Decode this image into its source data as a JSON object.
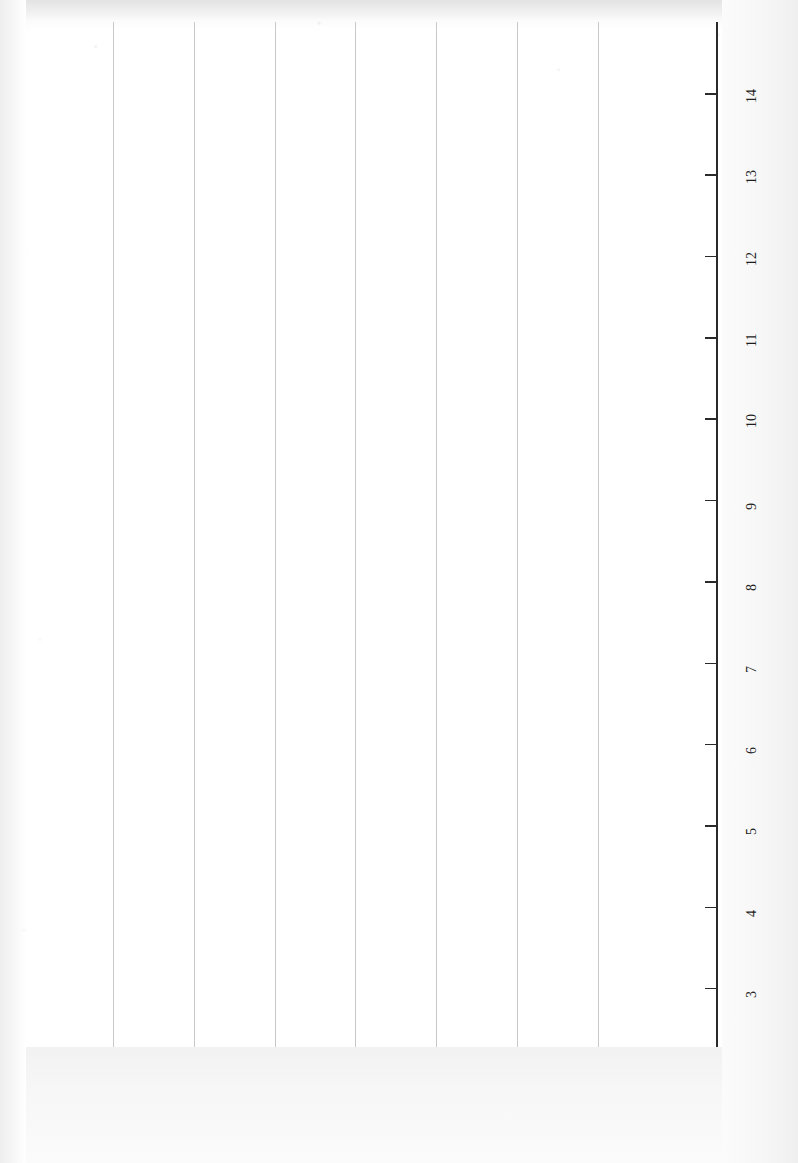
{
  "chart_data": {
    "type": "scatter",
    "title": "",
    "xlabel": "Voter Eligibility Percent",
    "ylabel": "Democratic Advantage",
    "orientation": "rotated-90",
    "grid": "vertical-gridlines-on-democratic-advantage-axis",
    "legend": "none",
    "xlim": [
      2.6,
      14.6
    ],
    "ylim": [
      -2.9,
      4.1
    ],
    "x_ticks": [
      3,
      4,
      5,
      6,
      7,
      8,
      9,
      10,
      11,
      12,
      13,
      14
    ],
    "y_ticks": [
      "3.59",
      "2.59",
      "1.59",
      "0.59",
      "-0.41",
      "-1.41",
      "-2.41"
    ],
    "y_tick_values": [
      3.59,
      2.59,
      1.59,
      0.59,
      -0.41,
      -1.41,
      -2.41
    ],
    "point_label_field": "state",
    "points": [
      {
        "state": "CO",
        "x": 4.45,
        "y": 4.0
      },
      {
        "state": "NH",
        "x": 2.95,
        "y": 3.16
      },
      {
        "state": "NE",
        "x": 5.95,
        "y": 3.7
      },
      {
        "state": "DE",
        "x": 6.45,
        "y": 3.52
      },
      {
        "state": "KS",
        "x": 6.38,
        "y": 3.45
      },
      {
        "state": "ME",
        "x": 3.55,
        "y": 2.9
      },
      {
        "state": "WY",
        "x": 4.18,
        "y": 2.93
      },
      {
        "state": "MD",
        "x": 4.0,
        "y": 2.8
      },
      {
        "state": "VT",
        "x": 9.45,
        "y": 2.93
      },
      {
        "state": "CT",
        "x": 6.85,
        "y": 2.74
      },
      {
        "state": "AK",
        "x": 7.2,
        "y": 2.88
      },
      {
        "state": "MN",
        "x": 5.2,
        "y": 2.55
      },
      {
        "state": "GA",
        "x": 8.1,
        "y": 2.52
      },
      {
        "state": "MT",
        "x": 8.8,
        "y": 2.67
      },
      {
        "state": "SD",
        "x": 6.22,
        "y": 2.32
      },
      {
        "state": "RI",
        "x": 6.15,
        "y": 2.25
      },
      {
        "state": "KY",
        "x": 5.55,
        "y": 2.27
      },
      {
        "state": "ID",
        "x": 7.32,
        "y": 2.38
      },
      {
        "state": "WV",
        "x": 7.65,
        "y": 2.43
      },
      {
        "state": "OR",
        "x": 7.8,
        "y": 2.31
      },
      {
        "state": "VA",
        "x": 6.95,
        "y": 2.22
      },
      {
        "state": "MA",
        "x": 4.45,
        "y": 2.38
      },
      {
        "state": "ND",
        "x": 2.95,
        "y": 2.43
      },
      {
        "state": "AZ",
        "x": 10.05,
        "y": 2.02
      },
      {
        "state": "UT",
        "x": 11.35,
        "y": 1.82
      },
      {
        "state": "TX",
        "x": 9.0,
        "y": 1.9
      },
      {
        "state": "MI",
        "x": 8.3,
        "y": 1.66
      },
      {
        "state": "WA",
        "x": 10.25,
        "y": 1.71
      },
      {
        "state": "TN",
        "x": 7.92,
        "y": 1.62
      },
      {
        "state": "SC",
        "x": 7.45,
        "y": 1.52
      },
      {
        "state": "OK",
        "x": 2.95,
        "y": 1.52
      },
      {
        "state": "MO",
        "x": 3.4,
        "y": 1.48
      },
      {
        "state": "IN",
        "x": 3.42,
        "y": 1.46
      },
      {
        "state": "PA",
        "x": 7.3,
        "y": 1.24
      },
      {
        "state": "NJ",
        "x": 9.35,
        "y": 1.3
      },
      {
        "state": "NC",
        "x": 6.55,
        "y": 1.08
      },
      {
        "state": "NM",
        "x": 6.4,
        "y": 1.0
      },
      {
        "state": "AL",
        "x": 3.97,
        "y": 0.92
      },
      {
        "state": "IA",
        "x": 4.05,
        "y": 0.82
      },
      {
        "state": "WI",
        "x": 6.2,
        "y": 0.8
      },
      {
        "state": "MS",
        "x": 5.05,
        "y": 0.72
      },
      {
        "state": "LA",
        "x": 3.92,
        "y": 0.62
      },
      {
        "state": "NV",
        "x": 7.95,
        "y": -0.06
      },
      {
        "state": "NY",
        "x": 5.98,
        "y": -0.14
      },
      {
        "state": "IL",
        "x": 4.0,
        "y": -0.22
      },
      {
        "state": "OH",
        "x": 3.3,
        "y": -0.15
      },
      {
        "state": "AR",
        "x": 2.92,
        "y": -0.35
      },
      {
        "state": "FL",
        "x": 6.12,
        "y": -1.28
      },
      {
        "state": "CA",
        "x": 10.3,
        "y": -1.18
      },
      {
        "state": "HI",
        "x": 14.28,
        "y": -2.38
      }
    ],
    "trendline": {
      "present": true,
      "style": "solid-thick-black",
      "x_start": 2.95,
      "y_start": 1.52,
      "x_end": 14.05,
      "y_end": 3.98
    }
  },
  "axis": {
    "x_title": "Voter Eligibility Percent",
    "y_title": "Democratic Advantage",
    "x_tick_labels": [
      "3",
      "4",
      "5",
      "6",
      "7",
      "8",
      "9",
      "10",
      "11",
      "12",
      "13",
      "14"
    ],
    "y_tick_labels": [
      "3.59",
      "2.59",
      "1.59",
      "0.59",
      "-0.41",
      "-1.41",
      "-2.41"
    ]
  },
  "colors": {
    "marker": "#0d0d0d",
    "trendline": "#080808",
    "gridline": "#c9c9c9",
    "axis": "#2a2a2a",
    "background": "#ffffff"
  }
}
